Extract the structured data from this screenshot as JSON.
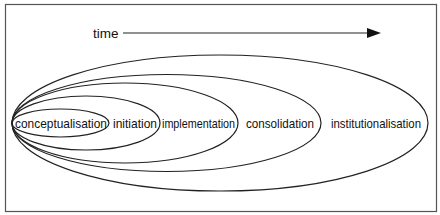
{
  "diagram": {
    "time_label": "time",
    "stages": [
      {
        "label": "conceptualisation"
      },
      {
        "label": "initiation"
      },
      {
        "label": "implementation"
      },
      {
        "label": "consolidation"
      },
      {
        "label": "institutionalisation"
      }
    ]
  },
  "colors": {
    "stroke": "#222222",
    "frame": "#555555",
    "background": "#ffffff"
  }
}
